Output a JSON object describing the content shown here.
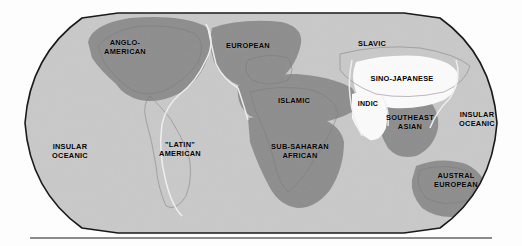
{
  "map": {
    "type": "world-cultural-regions-map",
    "projection": "robinson",
    "width": 522,
    "height": 246,
    "background_color": "#ffffff",
    "ocean_color": "#c9c9c9",
    "frame_color": "#1a1a1a",
    "shades": {
      "dark": "#8e8e8e",
      "light": "#c9c9c9",
      "white": "#fbfbfb",
      "land_outline": "#7a7a7a",
      "boundary": "#f2f2f2"
    },
    "regions": [
      {
        "id": "anglo-american",
        "label": "ANGLO-\nAMERICAN",
        "shade": "dark",
        "label_x": 125,
        "label_y": 48
      },
      {
        "id": "european",
        "label": "EUROPEAN",
        "shade": "dark",
        "label_x": 248,
        "label_y": 46
      },
      {
        "id": "slavic",
        "label": "SLAVIC",
        "shade": "light",
        "label_x": 372,
        "label_y": 44
      },
      {
        "id": "sino-japanese",
        "label": "SINO-JAPANESE",
        "shade": "white",
        "label_x": 402,
        "label_y": 79
      },
      {
        "id": "islamic",
        "label": "ISLAMIC",
        "shade": "dark",
        "label_x": 294,
        "label_y": 101
      },
      {
        "id": "indic",
        "label": "INDIC",
        "shade": "white",
        "label_x": 368,
        "label_y": 104
      },
      {
        "id": "southeast-asian",
        "label": "SOUTHEAST\nASIAN",
        "shade": "dark",
        "label_x": 410,
        "label_y": 123
      },
      {
        "id": "insular-oceanic-east",
        "label": "INSULAR\nOCEANIC",
        "shade": "light",
        "label_x": 477,
        "label_y": 120
      },
      {
        "id": "insular-oceanic-west",
        "label": "INSULAR\nOCEANIC",
        "shade": "light",
        "label_x": 70,
        "label_y": 152
      },
      {
        "id": "latin-american",
        "label": "\"LATIN\"\nAMERICAN",
        "shade": "light",
        "label_x": 180,
        "label_y": 150
      },
      {
        "id": "sub-saharan-african",
        "label": "SUB-SAHARAN\nAFRICAN",
        "shade": "dark",
        "label_x": 300,
        "label_y": 152
      },
      {
        "id": "austral-european",
        "label": "AUSTRAL\nEUROPEAN",
        "shade": "dark",
        "label_x": 456,
        "label_y": 181
      }
    ]
  }
}
